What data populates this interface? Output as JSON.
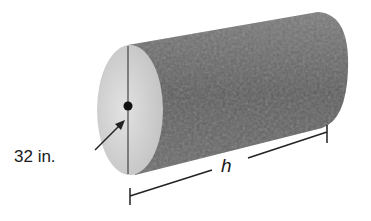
{
  "figure": {
    "diameter_label": "32 in.",
    "height_label": "h",
    "colors": {
      "bark": "#6e6e6e",
      "bark_dark": "#4a4a4a",
      "end_face": "#d4d4d4",
      "line": "#222222"
    }
  }
}
